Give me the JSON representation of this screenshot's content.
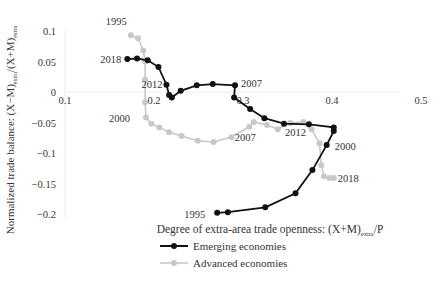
{
  "chart_data": {
    "type": "line",
    "title": "",
    "xlabel": "Degree of extra-area trade openness: (X+M)",
    "xlabel_sub": "extra",
    "xlabel_tail": "/P",
    "ylabel_main": "Normalized trade balance: (X−M)",
    "ylabel_sub1": "extra",
    "ylabel_mid": "/(X+M)",
    "ylabel_sub2": "extra",
    "xlim": [
      0.1,
      0.5
    ],
    "ylim": [
      -0.2,
      0.1
    ],
    "x_ticks": [
      0.1,
      0.2,
      0.3,
      0.4,
      0.5
    ],
    "x_tick_labels": [
      "0.1",
      "0.2",
      "0.3",
      "0.4",
      "0.5"
    ],
    "y_ticks": [
      0.1,
      0.05,
      0,
      -0.05,
      -0.1,
      -0.15,
      -0.2
    ],
    "y_tick_labels": [
      "0.1",
      "0.05",
      "0",
      "−0.05",
      "−0.1",
      "−0.15",
      "−0.2"
    ],
    "grid": false,
    "legend_position": "bottom",
    "series": [
      {
        "name": "Emerging economies",
        "color": "#111111",
        "points": [
          [
            0.271,
            -0.198
          ],
          [
            0.283,
            -0.197
          ],
          [
            0.325,
            -0.189
          ],
          [
            0.359,
            -0.166
          ],
          [
            0.378,
            -0.128
          ],
          [
            0.394,
            -0.087
          ],
          [
            0.402,
            -0.064
          ],
          [
            0.402,
            -0.058
          ],
          [
            0.374,
            -0.053
          ],
          [
            0.346,
            -0.052
          ],
          [
            0.324,
            -0.043
          ],
          [
            0.308,
            -0.028
          ],
          [
            0.29,
            -0.009
          ],
          [
            0.291,
            0.011
          ],
          [
            0.266,
            0.013
          ],
          [
            0.248,
            0.011
          ],
          [
            0.23,
            0.002
          ],
          [
            0.22,
            -0.009
          ],
          [
            0.217,
            -0.005
          ],
          [
            0.214,
            0.012
          ],
          [
            0.205,
            0.041
          ],
          [
            0.193,
            0.052
          ],
          [
            0.181,
            0.055
          ],
          [
            0.17,
            0.054
          ]
        ],
        "annotations": [
          {
            "label": "1995",
            "x": 0.271,
            "y": -0.198
          },
          {
            "label": "2000",
            "x": 0.394,
            "y": -0.087
          },
          {
            "label": "2007",
            "x": 0.291,
            "y": 0.011
          },
          {
            "label": "2012",
            "x": 0.214,
            "y": 0.012
          },
          {
            "label": "2018",
            "x": 0.17,
            "y": 0.054
          }
        ]
      },
      {
        "name": "Advanced economies",
        "color": "#c8c8c8",
        "points": [
          [
            0.174,
            0.093
          ],
          [
            0.182,
            0.088
          ],
          [
            0.188,
            0.068
          ],
          [
            0.19,
            0.05
          ],
          [
            0.19,
            0.02
          ],
          [
            0.19,
            -0.017
          ],
          [
            0.191,
            -0.042
          ],
          [
            0.197,
            -0.052
          ],
          [
            0.206,
            -0.058
          ],
          [
            0.217,
            -0.066
          ],
          [
            0.231,
            -0.072
          ],
          [
            0.249,
            -0.08
          ],
          [
            0.267,
            -0.082
          ],
          [
            0.287,
            -0.074
          ],
          [
            0.307,
            -0.057
          ],
          [
            0.312,
            -0.049
          ],
          [
            0.327,
            -0.054
          ],
          [
            0.339,
            -0.061
          ],
          [
            0.353,
            -0.051
          ],
          [
            0.368,
            -0.049
          ],
          [
            0.377,
            -0.061
          ],
          [
            0.386,
            -0.084
          ],
          [
            0.388,
            -0.12
          ],
          [
            0.391,
            -0.138
          ],
          [
            0.397,
            -0.141
          ],
          [
            0.402,
            -0.141
          ]
        ],
        "annotations": [
          {
            "label": "1995",
            "x": 0.174,
            "y": 0.093
          },
          {
            "label": "2000",
            "x": 0.191,
            "y": -0.042
          },
          {
            "label": "2007",
            "x": 0.307,
            "y": -0.057
          },
          {
            "label": "2012",
            "x": 0.368,
            "y": -0.049
          },
          {
            "label": "2018",
            "x": 0.402,
            "y": -0.141
          }
        ]
      }
    ]
  },
  "legend": {
    "items": [
      {
        "label": "Emerging economies",
        "color": "#111111"
      },
      {
        "label": "Advanced economies",
        "color": "#c8c8c8"
      }
    ]
  }
}
